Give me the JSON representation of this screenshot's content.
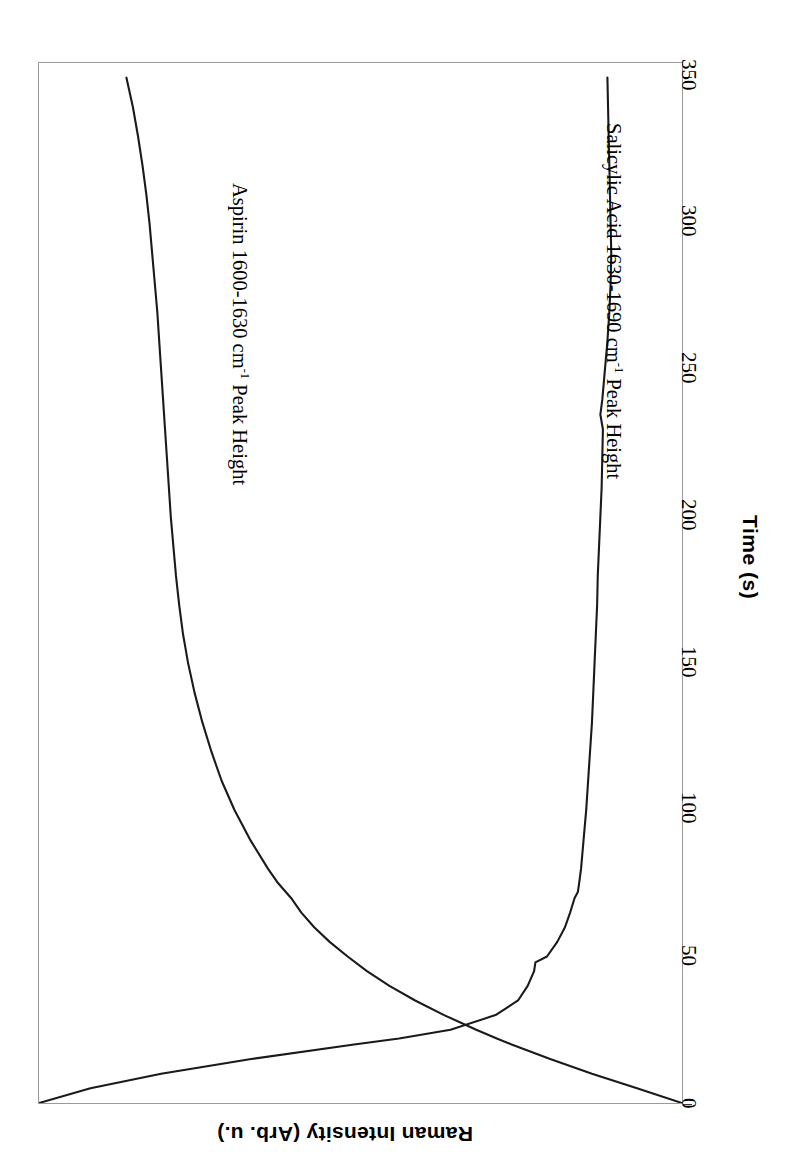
{
  "figure": {
    "background_color": "#ffffff",
    "frame_color": "#9a9a9a",
    "line_color": "#1a1a1a",
    "rotation_note": "chart rendered rotated 90 degrees clockwise"
  },
  "axes": {
    "x": {
      "title": "Time (s)",
      "ticks": [
        {
          "label": "0",
          "value": 0
        },
        {
          "label": "50",
          "value": 50
        },
        {
          "label": "100",
          "value": 100
        },
        {
          "label": "150",
          "value": 150
        },
        {
          "label": "200",
          "value": 200
        },
        {
          "label": "250",
          "value": 250
        },
        {
          "label": "300",
          "value": 300
        },
        {
          "label": "350",
          "value": 350
        }
      ],
      "range": [
        0,
        355
      ]
    },
    "y": {
      "title": "Raman Intensity (Arb. u.)",
      "ticks": [],
      "range": [
        0,
        1
      ]
    }
  },
  "series_labels": [
    {
      "id": "aspirin",
      "text_prefix": "Aspirin 1600-1630 cm",
      "superscript": "-1",
      "text_suffix": " Peak Height"
    },
    {
      "id": "salicylic",
      "text_prefix": "Salicylic Acid 1630-1690 cm",
      "superscript": "-1",
      "text_suffix": " Peak Height"
    }
  ],
  "chart_data": {
    "type": "line",
    "title": "",
    "xlabel": "Time (s)",
    "ylabel": "Raman Intensity (Arb. u.)",
    "xlim": [
      0,
      355
    ],
    "ylim": [
      0,
      1
    ],
    "grid": false,
    "legend": "inline-curve-labels",
    "orientation": "rotated-90-clockwise",
    "series": [
      {
        "name": "Aspirin 1600-1630 cm-1 Peak Height",
        "x": [
          0,
          5,
          10,
          15,
          20,
          22,
          25,
          30,
          35,
          40,
          45,
          50,
          55,
          60,
          65,
          70,
          75,
          80,
          90,
          100,
          110,
          120,
          130,
          140,
          150,
          155,
          160,
          170,
          180,
          190,
          200,
          210,
          220,
          230,
          240,
          250,
          260,
          270,
          280,
          290,
          300,
          310,
          320,
          330,
          340,
          350
        ],
        "y": [
          1.0,
          0.93,
          0.86,
          0.795,
          0.735,
          0.712,
          0.68,
          0.63,
          0.585,
          0.545,
          0.51,
          0.48,
          0.452,
          0.428,
          0.408,
          0.392,
          0.372,
          0.356,
          0.328,
          0.304,
          0.284,
          0.268,
          0.254,
          0.242,
          0.232,
          0.228,
          0.224,
          0.218,
          0.213,
          0.209,
          0.205,
          0.202,
          0.199,
          0.196,
          0.193,
          0.19,
          0.187,
          0.184,
          0.18,
          0.176,
          0.172,
          0.167,
          0.161,
          0.154,
          0.146,
          0.136
        ]
      },
      {
        "name": "Salicylic Acid 1630-1690 cm-1 Peak Height",
        "x": [
          0,
          5,
          10,
          15,
          20,
          22,
          25,
          30,
          35,
          40,
          45,
          48,
          50,
          55,
          60,
          65,
          70,
          72,
          75,
          80,
          90,
          100,
          110,
          120,
          130,
          140,
          150,
          160,
          170,
          180,
          190,
          200,
          210,
          220,
          230,
          235,
          240,
          250,
          260,
          270,
          280,
          290,
          300,
          310,
          320,
          330,
          340,
          350
        ],
        "y": [
          0.0,
          0.08,
          0.19,
          0.33,
          0.49,
          0.56,
          0.64,
          0.71,
          0.745,
          0.76,
          0.77,
          0.772,
          0.79,
          0.806,
          0.818,
          0.826,
          0.833,
          0.838,
          0.84,
          0.843,
          0.847,
          0.851,
          0.854,
          0.857,
          0.86,
          0.862,
          0.864,
          0.866,
          0.868,
          0.869,
          0.871,
          0.873,
          0.875,
          0.876,
          0.877,
          0.873,
          0.876,
          0.88,
          0.884,
          0.887,
          0.889,
          0.89,
          0.889,
          0.888,
          0.887,
          0.886,
          0.885,
          0.884
        ]
      }
    ],
    "annotations": [
      {
        "text": "curves cross near t = 22 s",
        "x": 22,
        "y": 0.71
      }
    ]
  }
}
